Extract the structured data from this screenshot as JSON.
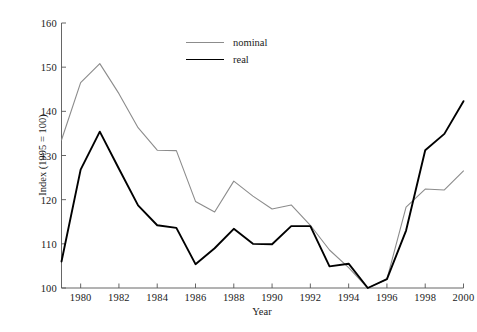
{
  "chart_data": {
    "type": "line",
    "title": "",
    "xlabel": "Year",
    "ylabel": "Index (1995 = 100)",
    "xlim": [
      1979,
      2000
    ],
    "ylim": [
      100,
      160
    ],
    "grid": false,
    "legend_position": "top-center",
    "x": [
      1979,
      1980,
      1981,
      1982,
      1983,
      1984,
      1985,
      1986,
      1987,
      1988,
      1989,
      1990,
      1991,
      1992,
      1993,
      1994,
      1995,
      1996,
      1997,
      1998,
      1999,
      2000
    ],
    "xticks": [
      1980,
      1982,
      1984,
      1986,
      1988,
      1990,
      1992,
      1994,
      1996,
      1998,
      2000
    ],
    "xtick_labels": [
      "1980",
      "1982",
      "1984",
      "1986",
      "1988",
      "1990",
      "1992",
      "1994",
      "1996",
      "1998",
      "2000"
    ],
    "yticks": [
      100,
      110,
      120,
      130,
      140,
      150,
      160
    ],
    "ytick_labels": [
      "100",
      "110",
      "120",
      "130",
      "140",
      "150",
      "160"
    ],
    "series": [
      {
        "name": "nominal",
        "color": "#8c8c8c",
        "line_width": 1.1,
        "values": [
          133.5,
          146.5,
          150.8,
          144.0,
          136.3,
          131.2,
          131.1,
          119.6,
          117.2,
          124.2,
          120.8,
          117.9,
          118.8,
          114.2,
          108.6,
          104.6,
          100.0,
          102.0,
          118.3,
          122.4,
          122.2,
          126.5
        ]
      },
      {
        "name": "real",
        "color": "#000000",
        "line_width": 1.9,
        "values": [
          106.0,
          126.8,
          135.4,
          127.0,
          118.7,
          114.2,
          113.6,
          105.4,
          109.0,
          113.4,
          110.0,
          109.9,
          114.0,
          114.0,
          104.9,
          105.5,
          100.0,
          102.0,
          113.0,
          131.2,
          134.9,
          142.3
        ]
      }
    ]
  },
  "legend": {
    "items": [
      {
        "label": "nominal"
      },
      {
        "label": "real"
      }
    ]
  },
  "axes": {
    "x_title": "Year",
    "y_title": "Index (1995 = 100)"
  },
  "colors": {
    "nominal": "#8c8c8c",
    "real": "#000000",
    "axis": "#555555",
    "background": "#ffffff"
  }
}
